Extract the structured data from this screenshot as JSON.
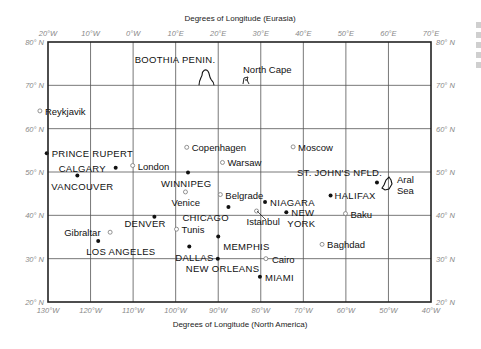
{
  "figure": {
    "title_top": "Degrees of Longitude (Eurasia)",
    "title_bottom": "Degrees of Longitude (North America)",
    "top_ticks": [
      "20°W",
      "10°W",
      "0°W",
      "10°E",
      "20°E",
      "30°E",
      "40°E",
      "50°E",
      "60°E",
      "70°E"
    ],
    "bottom_ticks": [
      "130°W",
      "120°W",
      "110°W",
      "100°W",
      "90°W",
      "80°W",
      "70°W",
      "60°W",
      "50°W",
      "40°W"
    ],
    "lat_ticks": [
      "80° N",
      "70° N",
      "60° N",
      "50° N",
      "40° N",
      "30° N",
      "20° N"
    ],
    "lat_values": [
      80,
      70,
      60,
      50,
      40,
      30,
      20
    ],
    "na_lon_range": [
      -130,
      -40
    ],
    "eu_lon_range": [
      -20,
      70
    ],
    "lat_range": [
      20,
      80
    ]
  },
  "landmarks": [
    {
      "label": "BOOTHIA PENIN.",
      "kind": "na",
      "lon_na": -90,
      "lat": 71,
      "shape": "boothia"
    },
    {
      "label": "North Cape",
      "kind": "eu",
      "lon_eu": 25.8,
      "lat": 71,
      "shape": "northcape"
    },
    {
      "label": "Aral Sea",
      "kind": "eu",
      "lon_eu": 60,
      "lat": 45,
      "shape": "aral"
    }
  ],
  "cities": [
    {
      "label": "Reykjavik",
      "type": "eu",
      "lon_eu": -21.9,
      "lat": 64.1,
      "anchor": "right"
    },
    {
      "label": "PRINCE RUPERT",
      "type": "na",
      "lon_na": -130.3,
      "lat": 54.3,
      "anchor": "right"
    },
    {
      "label": "CALGARY",
      "type": "na",
      "lon_na": -114.1,
      "lat": 51.0,
      "anchor": "left"
    },
    {
      "label": "London",
      "type": "eu",
      "lon_eu": -0.1,
      "lat": 51.5,
      "anchor": "right"
    },
    {
      "label": "VANCOUVER",
      "type": "na",
      "lon_na": -123.1,
      "lat": 49.2,
      "anchor": "below"
    },
    {
      "label": "Copenhagen",
      "type": "eu",
      "lon_eu": 12.6,
      "lat": 55.7,
      "anchor": "right"
    },
    {
      "label": "Warsaw",
      "type": "eu",
      "lon_eu": 21.0,
      "lat": 52.2,
      "anchor": "right"
    },
    {
      "label": "Moscow",
      "type": "eu",
      "lon_eu": 37.6,
      "lat": 55.8,
      "anchor": "right"
    },
    {
      "label": "WINNIPEG",
      "type": "na",
      "lon_na": -97.1,
      "lat": 49.9,
      "anchor": "below"
    },
    {
      "label": "Belgrade",
      "type": "eu",
      "lon_eu": 20.5,
      "lat": 44.8,
      "anchor": "right"
    },
    {
      "label": "Venice",
      "type": "eu",
      "lon_eu": 12.3,
      "lat": 45.4,
      "anchor": "below"
    },
    {
      "label": "CHICAGO",
      "type": "na",
      "lon_na": -87.6,
      "lat": 41.9,
      "anchor": "below-left"
    },
    {
      "label": "NIAGARA",
      "type": "na",
      "lon_na": -79.0,
      "lat": 43.1,
      "anchor": "right"
    },
    {
      "label": "Istanbul",
      "type": "eu",
      "lon_eu": 29.0,
      "lat": 41.0,
      "anchor": "below-right"
    },
    {
      "label": "NEW YORK",
      "type": "na",
      "lon_na": -74.0,
      "lat": 40.7,
      "anchor": "right"
    },
    {
      "label": "ST. JOHN'S NFLD.",
      "type": "na",
      "lon_na": -52.7,
      "lat": 47.6,
      "anchor": "above-left"
    },
    {
      "label": "HALIFAX",
      "type": "na",
      "lon_na": -63.6,
      "lat": 44.6,
      "anchor": "right"
    },
    {
      "label": "Baku",
      "type": "eu",
      "lon_eu": 49.9,
      "lat": 40.4,
      "anchor": "right"
    },
    {
      "label": "DENVER",
      "type": "na",
      "lon_na": -105.0,
      "lat": 39.7,
      "anchor": "below"
    },
    {
      "label": "Gibraltar",
      "type": "eu",
      "lon_eu": -5.4,
      "lat": 36.1,
      "anchor": "left"
    },
    {
      "label": "Tunis",
      "type": "eu",
      "lon_eu": 10.2,
      "lat": 36.8,
      "anchor": "right"
    },
    {
      "label": "LOS ANGELES",
      "type": "na",
      "lon_na": -118.2,
      "lat": 34.1,
      "anchor": "below-right"
    },
    {
      "label": "DALLAS",
      "type": "na",
      "lon_na": -96.8,
      "lat": 32.8,
      "anchor": "below"
    },
    {
      "label": "MEMPHIS",
      "type": "na",
      "lon_na": -90.0,
      "lat": 35.1,
      "anchor": "below-right"
    },
    {
      "label": "Baghdad",
      "type": "eu",
      "lon_eu": 44.4,
      "lat": 33.3,
      "anchor": "right"
    },
    {
      "label": "NEW ORLEANS",
      "type": "na",
      "lon_na": -90.1,
      "lat": 30.0,
      "anchor": "below"
    },
    {
      "label": "Cairo",
      "type": "eu",
      "lon_eu": 31.2,
      "lat": 30.0,
      "anchor": "right"
    },
    {
      "label": "MIAMI",
      "type": "na",
      "lon_na": -80.2,
      "lat": 25.8,
      "anchor": "right"
    }
  ]
}
